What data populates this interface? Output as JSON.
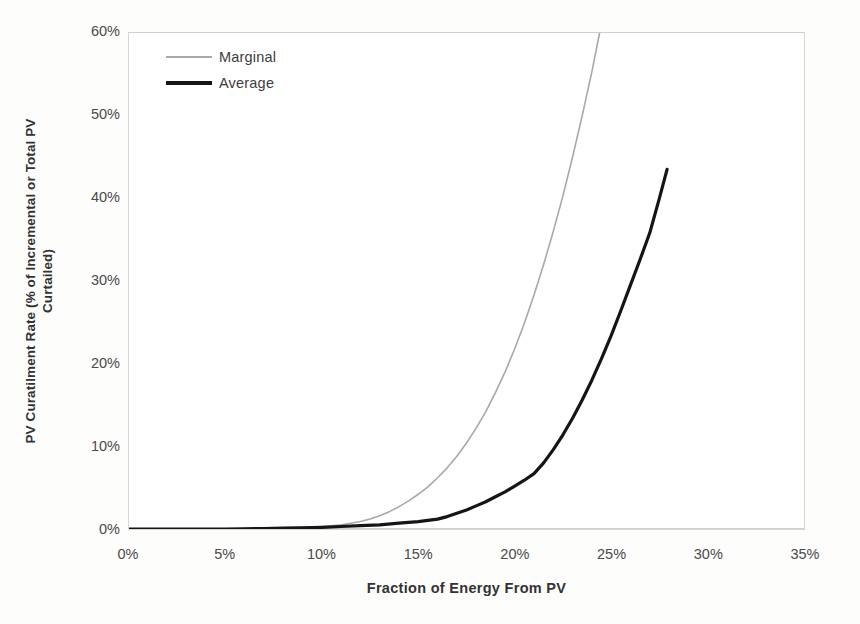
{
  "chart_data": {
    "type": "line",
    "title": "",
    "xlabel": "Fraction of Energy From PV",
    "ylabel_line1": "PV Curatilment Rate (% of Incremental or Total PV",
    "ylabel_line2": "Curtailed)",
    "xlim": [
      0,
      35
    ],
    "ylim": [
      0,
      60
    ],
    "xticks": [
      "0%",
      "5%",
      "10%",
      "15%",
      "20%",
      "25%",
      "30%",
      "35%"
    ],
    "xtick_values": [
      0,
      5,
      10,
      15,
      20,
      25,
      30,
      35
    ],
    "yticks": [
      "0%",
      "10%",
      "20%",
      "30%",
      "40%",
      "50%",
      "60%"
    ],
    "ytick_values": [
      0,
      10,
      20,
      30,
      40,
      50,
      60
    ],
    "grid": false,
    "legend_position": "top-left",
    "series": [
      {
        "name": "Marginal",
        "color": "#a8a8a8",
        "width": 1.6,
        "x": [
          0,
          1,
          2,
          3,
          4,
          5,
          6,
          7,
          8,
          9,
          10,
          10.5,
          11,
          11.5,
          12,
          12.5,
          13,
          13.5,
          14,
          14.5,
          15,
          15.5,
          16,
          16.5,
          17,
          17.5,
          18,
          18.5,
          19,
          19.5,
          20,
          20.5,
          21,
          21.5,
          22,
          22.5,
          23,
          23.5,
          24,
          24.4
        ],
        "values": [
          0,
          0,
          0,
          0,
          0,
          0,
          0.05,
          0.1,
          0.15,
          0.2,
          0.3,
          0.4,
          0.5,
          0.7,
          0.9,
          1.2,
          1.6,
          2.1,
          2.7,
          3.4,
          4.2,
          5.1,
          6.2,
          7.4,
          8.8,
          10.4,
          12.2,
          14.2,
          16.5,
          19.0,
          21.8,
          24.9,
          28.3,
          32.0,
          36.0,
          40.3,
          45.0,
          50.0,
          55.3,
          60.0
        ]
      },
      {
        "name": "Average",
        "color": "#151515",
        "width": 3.2,
        "x": [
          0,
          1,
          2,
          3,
          4,
          5,
          6,
          7,
          8,
          9,
          10,
          11,
          12,
          13,
          14,
          15,
          16,
          16.5,
          17,
          17.5,
          18,
          18.5,
          19,
          19.5,
          20,
          20.5,
          21,
          21.5,
          22,
          22.5,
          23,
          23.5,
          24,
          24.5,
          25,
          25.5,
          26,
          26.5,
          27,
          27.5,
          27.9
        ],
        "values": [
          0,
          0,
          0,
          0,
          0,
          0,
          0.02,
          0.05,
          0.1,
          0.15,
          0.2,
          0.3,
          0.4,
          0.5,
          0.7,
          0.9,
          1.2,
          1.5,
          1.9,
          2.3,
          2.8,
          3.3,
          3.9,
          4.5,
          5.2,
          5.9,
          6.7,
          8.0,
          9.6,
          11.4,
          13.4,
          15.6,
          18.0,
          20.6,
          23.4,
          26.4,
          29.5,
          32.6,
          35.8,
          40.0,
          43.5
        ]
      }
    ]
  },
  "legend": {
    "items": [
      {
        "label": "Marginal"
      },
      {
        "label": "Average"
      }
    ]
  }
}
